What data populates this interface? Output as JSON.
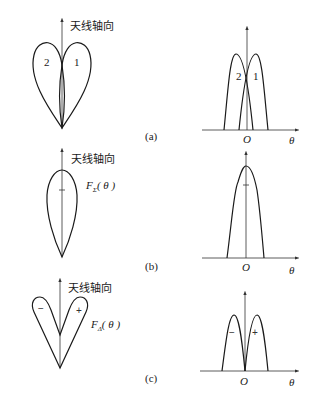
{
  "diagram": {
    "axis_label": "天线轴向",
    "panels": [
      {
        "id": "a",
        "panel_label": "(a)",
        "lobe_labels": [
          "2",
          "1"
        ],
        "origin_label": "O",
        "x_axis_label": "θ"
      },
      {
        "id": "b",
        "panel_label": "(b)",
        "function_label": {
          "main": "F",
          "sub": "Σ",
          "arg": "( θ )"
        },
        "origin_label": "O",
        "x_axis_label": "θ"
      },
      {
        "id": "c",
        "panel_label": "(c)",
        "function_label": {
          "main": "F",
          "sub": "Δ",
          "arg": "( θ )"
        },
        "sign_labels": [
          "−",
          "+"
        ],
        "origin_label": "O",
        "x_axis_label": "θ"
      }
    ]
  }
}
